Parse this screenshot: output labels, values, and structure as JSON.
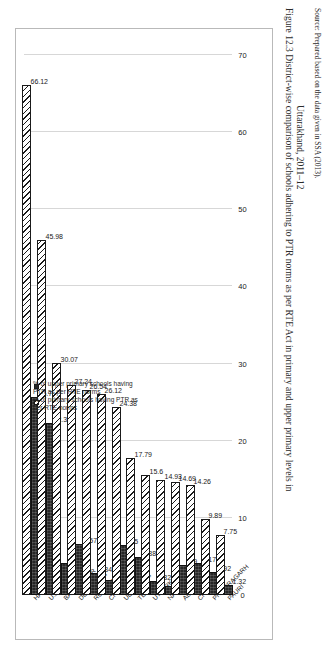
{
  "figure": {
    "caption_line1": "Figure 12.3  District-wise comparison of schools adhering to PTR norms as per RTE Act in primary and upper primary levels in",
    "caption_line2": "Uttarakhand, 2011–12",
    "source": "Source: Prepared based on the data given in SSA (2013)."
  },
  "legend": {
    "position": "top-left",
    "items": [
      {
        "key": "primary",
        "label": "% of primary schools having PTR as per RTE norms",
        "swatch": "hatched-white"
      },
      {
        "key": "upper",
        "label": "% of upper primary schools having PTR as per RTE norms",
        "swatch": "solid-dark"
      }
    ]
  },
  "axis": {
    "ticks": [
      "70",
      "60",
      "50",
      "40",
      "30",
      "20",
      "10",
      "0"
    ],
    "min": 0,
    "max": 70
  },
  "chart_data": {
    "type": "bar",
    "orientation": "horizontal",
    "xlabel": "",
    "ylabel": "",
    "ylim": [
      0,
      70
    ],
    "grid": true,
    "legend_position": "top-left",
    "categories": [
      "HARIDWAR",
      "U.S. NAGAR",
      "BAGESHWAR",
      "DEHRADUN",
      "RUDRAPRAYAG",
      "CHAMPAWAT",
      "Uttarakhand",
      "TEHRI",
      "UTTARKASHI",
      "NAINITAL",
      "ALMORA",
      "CHAMOLI",
      "PITHORAGARH",
      "PAURI"
    ],
    "series": [
      {
        "name": "% of primary schools having PTR as per RTE norms",
        "values": [
          66.12,
          45.98,
          30.07,
          27.24,
          26.54,
          26.12,
          24.38,
          17.79,
          15.6,
          14.93,
          14.69,
          14.26,
          9.89,
          7.75
        ]
      },
      {
        "name": "% of upper primary schools having PTR as per RTE norms",
        "values": [
          25.7,
          22.32,
          4.2,
          6.57,
          2.84,
          2.0,
          6.5,
          4.88,
          1.82,
          1.21,
          3.9,
          4.17,
          2.92,
          1.32
        ]
      }
    ],
    "value_labels": {
      "primary": [
        "66.12",
        "45.98",
        "30.07",
        "27.24",
        "26.54",
        "26.12",
        "24.38",
        "17.79",
        "15.6",
        "14.93",
        "14.69",
        "14.26",
        "9.89",
        "7.75"
      ],
      "upper": [
        "25.7",
        "22.32",
        "4.2",
        "6.57",
        "2.84",
        "2.00",
        "6.5",
        "4.88",
        "1.82",
        "1.21",
        "3.9",
        "4.17",
        "2.92",
        "1.32"
      ]
    }
  }
}
